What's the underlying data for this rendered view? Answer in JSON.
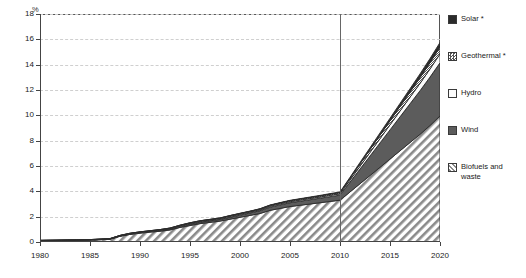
{
  "chart_data": {
    "type": "area",
    "title": "",
    "subtitle": "",
    "xlabel": "",
    "ylabel": "%",
    "unit_label": "%",
    "grid": true,
    "legend_position": "right",
    "xlim": [
      1980,
      2020
    ],
    "ylim": [
      0,
      18
    ],
    "ytick_step": 2,
    "x_ticks": [
      1980,
      1985,
      1990,
      1995,
      2000,
      2005,
      2010,
      2015,
      2020
    ],
    "y_ticks": [
      0,
      2,
      4,
      6,
      8,
      10,
      12,
      14,
      16,
      18
    ],
    "x": [
      1980,
      1981,
      1982,
      1983,
      1984,
      1985,
      1986,
      1987,
      1988,
      1989,
      1990,
      1991,
      1992,
      1993,
      1994,
      1995,
      1996,
      1997,
      1998,
      1999,
      2000,
      2001,
      2002,
      2003,
      2004,
      2005,
      2006,
      2007,
      2008,
      2009,
      2010,
      2011,
      2012,
      2013,
      2014,
      2015,
      2016,
      2017,
      2018,
      2019,
      2020
    ],
    "projection_start": 2010,
    "stack_order_bottom_to_top": [
      "Biofuels and waste",
      "Wind",
      "Hydro",
      "Geothermal *",
      "Solar *"
    ],
    "series": [
      {
        "name": "Biofuels and waste",
        "pattern": "diagonal-hatch",
        "color": "#d9d9d9",
        "values": [
          0.1,
          0.11,
          0.12,
          0.13,
          0.14,
          0.16,
          0.18,
          0.22,
          0.45,
          0.6,
          0.7,
          0.78,
          0.85,
          0.95,
          1.15,
          1.3,
          1.45,
          1.55,
          1.65,
          1.8,
          1.95,
          2.1,
          2.25,
          2.5,
          2.65,
          2.8,
          2.9,
          3.0,
          3.1,
          3.2,
          3.3,
          3.95,
          4.6,
          5.25,
          5.9,
          6.55,
          7.2,
          7.85,
          8.5,
          9.2,
          9.95
        ]
      },
      {
        "name": "Wind",
        "pattern": "solid-dark",
        "color": "#5c5c5c",
        "values": [
          0.0,
          0.0,
          0.0,
          0.0,
          0.0,
          0.0,
          0.01,
          0.01,
          0.02,
          0.03,
          0.04,
          0.05,
          0.06,
          0.07,
          0.08,
          0.1,
          0.11,
          0.12,
          0.13,
          0.15,
          0.17,
          0.19,
          0.22,
          0.25,
          0.28,
          0.3,
          0.32,
          0.34,
          0.36,
          0.38,
          0.4,
          0.78,
          1.16,
          1.54,
          1.92,
          2.3,
          2.68,
          3.06,
          3.44,
          3.82,
          4.2
        ]
      },
      {
        "name": "Hydro",
        "pattern": "light",
        "color": "#f2f2f2",
        "values": [
          0.02,
          0.02,
          0.02,
          0.02,
          0.02,
          0.02,
          0.02,
          0.02,
          0.03,
          0.03,
          0.03,
          0.03,
          0.04,
          0.04,
          0.05,
          0.06,
          0.06,
          0.06,
          0.06,
          0.07,
          0.07,
          0.07,
          0.07,
          0.08,
          0.08,
          0.08,
          0.09,
          0.09,
          0.09,
          0.1,
          0.1,
          0.16,
          0.22,
          0.28,
          0.34,
          0.4,
          0.46,
          0.52,
          0.58,
          0.64,
          0.7
        ]
      },
      {
        "name": "Geothermal *",
        "pattern": "checker",
        "color": "#9e9e9e",
        "values": [
          0.01,
          0.01,
          0.01,
          0.01,
          0.01,
          0.01,
          0.02,
          0.02,
          0.02,
          0.03,
          0.03,
          0.03,
          0.03,
          0.04,
          0.04,
          0.05,
          0.05,
          0.05,
          0.05,
          0.06,
          0.06,
          0.06,
          0.07,
          0.07,
          0.07,
          0.08,
          0.08,
          0.08,
          0.09,
          0.09,
          0.1,
          0.14,
          0.19,
          0.23,
          0.28,
          0.32,
          0.37,
          0.41,
          0.46,
          0.5,
          0.55
        ]
      },
      {
        "name": "Solar *",
        "pattern": "solid-black",
        "color": "#2b2b2b",
        "values": [
          0.0,
          0.0,
          0.0,
          0.0,
          0.0,
          0.0,
          0.0,
          0.0,
          0.0,
          0.0,
          0.0,
          0.0,
          0.0,
          0.0,
          0.01,
          0.01,
          0.01,
          0.01,
          0.01,
          0.01,
          0.02,
          0.02,
          0.02,
          0.02,
          0.03,
          0.03,
          0.03,
          0.04,
          0.04,
          0.05,
          0.05,
          0.08,
          0.11,
          0.14,
          0.17,
          0.2,
          0.23,
          0.26,
          0.29,
          0.32,
          0.35
        ]
      }
    ],
    "totals": [
      0.13,
      0.14,
      0.15,
      0.16,
      0.17,
      0.19,
      0.23,
      0.27,
      0.52,
      0.69,
      0.8,
      0.89,
      0.98,
      1.1,
      1.33,
      1.52,
      1.68,
      1.79,
      1.9,
      2.09,
      2.27,
      2.44,
      2.63,
      2.92,
      3.11,
      3.29,
      3.42,
      3.55,
      3.68,
      3.82,
      3.95,
      5.11,
      6.28,
      7.44,
      8.61,
      9.77,
      10.94,
      12.1,
      13.27,
      14.48,
      15.75
    ]
  },
  "legend": {
    "items": [
      {
        "label": "Solar *",
        "swatch": "solid-black-swatch"
      },
      {
        "label": "Geothermal *",
        "swatch": "checker-swatch"
      },
      {
        "label": "Hydro",
        "swatch": "light-swatch"
      },
      {
        "label": "Wind",
        "swatch": "solid-dark-swatch"
      },
      {
        "label": "Biofuels and\nwaste",
        "swatch": "hatch-swatch"
      }
    ]
  },
  "axes": {
    "y_labels": [
      "18",
      "16",
      "14",
      "12",
      "10",
      "8",
      "6",
      "4",
      "2",
      "0"
    ],
    "x_labels": [
      "1980",
      "1985",
      "1990",
      "1995",
      "2000",
      "2005",
      "2010",
      "2015",
      "2020"
    ],
    "unit": "%"
  }
}
